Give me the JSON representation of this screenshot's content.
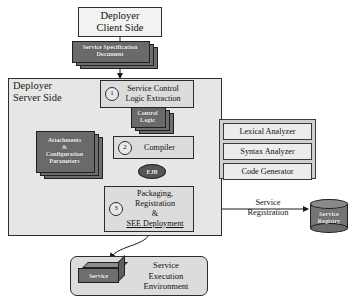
{
  "diagram": {
    "client": {
      "box_label": "Deployer\nClient Side",
      "box_line1": "Deployer",
      "box_line2": "Client Side"
    },
    "spec_document": {
      "line1": "Service Specification",
      "line2": "Document"
    },
    "server": {
      "label_line1": "Deployer",
      "label_line2": "Server Side"
    },
    "steps": [
      {
        "number": "1",
        "line1": "Service Control",
        "line2": "Logic Extraction"
      },
      {
        "number": "2",
        "line1": "Compiler"
      },
      {
        "number": "3",
        "line1": "Packaging,",
        "line2": "Registration",
        "line3": "&",
        "line4": "SEE Deployment"
      }
    ],
    "control_logic_document": {
      "line1": "Control",
      "line2": "Logic"
    },
    "attachments_document": {
      "line1": "Attachments",
      "line2": "&",
      "line3": "Configuration",
      "line4": "Parameters"
    },
    "ejb_artifact": "EJB",
    "compiler_components": [
      "Lexical Analyzer",
      "Syntax Analyzer",
      "Code Generator"
    ],
    "service_registration": {
      "line1": "Service",
      "line2": "Registration"
    },
    "registry": {
      "line1": "Service",
      "line2": "Registry"
    },
    "execution_environment": {
      "line1": "Service",
      "line2": "Execution",
      "line3": "Environment",
      "artifact_label": "Service"
    },
    "colors": {
      "document_fill": "#6e6e6e",
      "box_fill": "#dcdcdc",
      "panel_fill": "#cfcfcf",
      "container_fill": "#e6e6e4",
      "stroke": "#2b2b2b",
      "artifact_text": "#ffffff"
    }
  }
}
